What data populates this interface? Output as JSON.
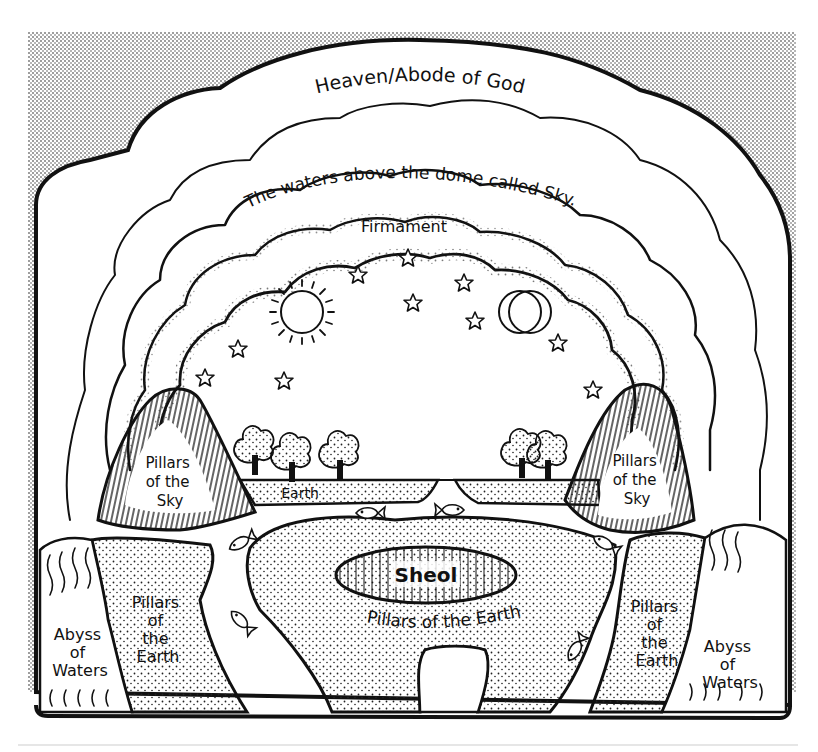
{
  "diagram": {
    "colors": {
      "ink": "#111111",
      "paper": "#ffffff",
      "stipple": "#222222"
    },
    "labels": {
      "heaven": "Heaven/Abode of God",
      "waters_above": "The waters above the dome called Sky.",
      "firmament": "Firmament",
      "pillars_sky_left": [
        "Pillars",
        "of the",
        "Sky"
      ],
      "pillars_sky_right": [
        "Pillars",
        "of the",
        "Sky"
      ],
      "earth": "Earth",
      "sheol": "Sheol",
      "pillars_earth_center": "Pillars of the Earth",
      "pillars_earth_left": [
        "Pillars",
        "of",
        "the",
        "Earth"
      ],
      "pillars_earth_right": [
        "Pillars",
        "of",
        "the",
        "Earth"
      ],
      "abyss_left": [
        "Abyss",
        "of",
        "Waters"
      ],
      "abyss_right": [
        "Abyss",
        "of",
        "Waters"
      ]
    },
    "icons": {
      "sun": "sun-icon",
      "moon": "crescent-moon-icon",
      "stars": "star-icon",
      "fish": "fish-icon",
      "trees": "tree-icon"
    },
    "counts": {
      "stars": 12,
      "fish": 6,
      "trees": 5
    }
  }
}
